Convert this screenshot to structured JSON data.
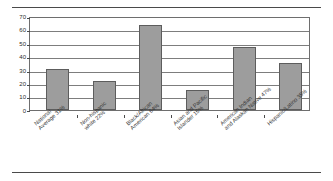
{
  "chart_data": {
    "type": "bar",
    "title": "",
    "subtitle": "",
    "xlabel": "",
    "ylabel": "",
    "ylim": [
      0,
      70
    ],
    "ytick_step": 10,
    "grid": true,
    "legend": false,
    "legend_position": "none",
    "orientation": "vertical",
    "bar_color": "#9d9d9d",
    "bar_border_color": "#5d5d5d",
    "categories": [
      "National Average 31%",
      "Non-hispanic white 22%",
      "Black/African American 64%",
      "Asian and Pacific Islander 15%",
      "American Indian and Alaskan Native 47%",
      "Hispanic/Latino 35%"
    ],
    "values": [
      31,
      22,
      64,
      15,
      47,
      35
    ],
    "ytick_labels": [
      "70",
      "60",
      "50",
      "40",
      "30",
      "20",
      "10",
      "0"
    ],
    "ytick_values": [
      70,
      60,
      50,
      40,
      30,
      20,
      10,
      0
    ],
    "category_labels": [
      {
        "line1": "National",
        "line2": "Average 31%"
      },
      {
        "line1": "Non-hispanic",
        "line2": "white 22%"
      },
      {
        "line1": "Black/African",
        "line2": "American 64%"
      },
      {
        "line1": "Asian and Pacific",
        "line2": "Islander 15%"
      },
      {
        "line1": "American Indian",
        "line2": "and Alaskan Native 47%"
      },
      {
        "line1": "Hispanic/Latino 35%",
        "line2": ""
      }
    ]
  },
  "figure": {
    "rule_color": "#4a4a4a",
    "frame_color": "#6e6e6e",
    "background": "#ffffff"
  }
}
